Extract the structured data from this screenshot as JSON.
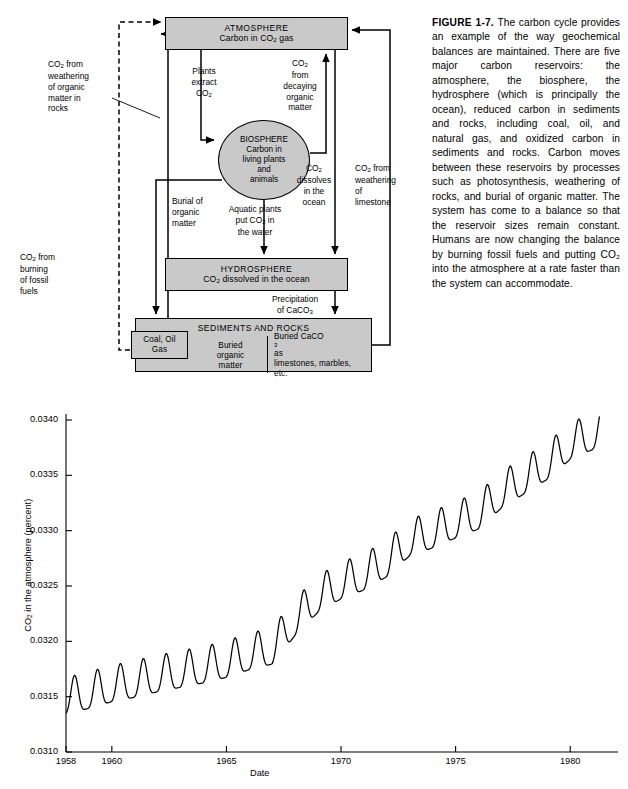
{
  "figure": {
    "number": "FIGURE 1-7.",
    "caption": " The carbon cycle provides an example of the way geochemical balances are maintained. There are five major carbon reservoirs: the atmosphere, the biosphere, the hydrosphere (which is principally the ocean), reduced carbon in sediments and rocks, including coal, oil, and natural gas, and oxidized carbon in sediments and rocks. Carbon moves between these reservoirs by processes such as photosynthesis, weathering of rocks, and burial of organic matter. The system has come to a balance so that the reservoir sizes remain constant. Humans are now changing the balance by burning fossil fuels and putting CO₂ into the atmosphere at a rate faster than the system can accommodate."
  },
  "diagram": {
    "boxes": {
      "atmosphere": {
        "title": "ATMOSPHERE",
        "subtitle": "Carbon in CO₂ gas"
      },
      "hydrosphere": {
        "title": "HYDROSPHERE",
        "subtitle": "CO₂ dissolved in the ocean"
      },
      "sediments": {
        "title": "SEDIMENTS AND ROCKS",
        "cells": [
          {
            "name": "coal-oil-gas",
            "text": "Coal, Oil\nGas"
          },
          {
            "name": "buried-organic-matter",
            "text": "Buried\norganic\nmatter"
          },
          {
            "name": "buried-caco3",
            "text": "Buried CaCO₃ as\nlimestones, marbles,\netc."
          }
        ]
      },
      "biosphere": {
        "title": "BIOSPHERE",
        "subtitle": "Carbon in\nliving plants\nand\nanimals"
      }
    },
    "flow_labels": {
      "plants_extract": "Plants\nextract\nCO₂",
      "decaying_organic": "CO₂\nfrom\ndecaying\norganic\nmatter",
      "co2_dissolves": "CO₂\ndissolves\nin the\nocean",
      "burial_organic": "Burial of\norganic\nmatter",
      "aquatic_plants": "Aquatic plants\nput CO₂ in\nthe water",
      "precipitation_caco3": "Precipitation\nof CaCO₃",
      "weathering_organic": "CO₂ from\nweathering\nof organic\nmatter in\nrocks",
      "burning_fossil": "CO₂ from\nburning\nof fossil\nfuels",
      "weathering_limestone": "CO₂ from\nweathering\nof\nlimestone"
    },
    "colors": {
      "box_fill": "#c9c9c9",
      "stroke": "#000000"
    }
  },
  "chart_data": {
    "type": "line",
    "title": "",
    "xlabel": "Date",
    "ylabel": "CO₂ in the atmosphere (percent)",
    "xlim": [
      1958.0,
      1981.3
    ],
    "ylim": [
      0.031,
      0.034
    ],
    "xticks": [
      1958,
      1960,
      1965,
      1970,
      1975,
      1980
    ],
    "xtick_labels": [
      "1958",
      "1960",
      "1965",
      "1970",
      "1975",
      "1980"
    ],
    "yticks": [
      0.031,
      0.0315,
      0.032,
      0.0325,
      0.033,
      0.0335,
      0.034
    ],
    "ytick_labels": [
      "0.0310",
      "0.0315",
      "0.0320",
      "0.0325",
      "0.0330",
      "0.0335",
      "0.0340"
    ],
    "grid": false,
    "legend": null,
    "series": [
      {
        "name": "Atmospheric CO2 at Mauna Loa (monthly mean, percent)",
        "description": "Keeling curve: rising trend with annual seasonal oscillation, amplitude about 0.00035 percent",
        "trend_annual_means": [
          {
            "year": 1958,
            "value": 0.03151
          },
          {
            "year": 1959,
            "value": 0.03156
          },
          {
            "year": 1960,
            "value": 0.03162
          },
          {
            "year": 1961,
            "value": 0.03166
          },
          {
            "year": 1962,
            "value": 0.03171
          },
          {
            "year": 1963,
            "value": 0.03175
          },
          {
            "year": 1964,
            "value": 0.03179
          },
          {
            "year": 1965,
            "value": 0.03184
          },
          {
            "year": 1966,
            "value": 0.03191
          },
          {
            "year": 1967,
            "value": 0.03196
          },
          {
            "year": 1968,
            "value": 0.03222
          },
          {
            "year": 1969,
            "value": 0.03243
          },
          {
            "year": 1970,
            "value": 0.03255
          },
          {
            "year": 1971,
            "value": 0.03263
          },
          {
            "year": 1972,
            "value": 0.03275
          },
          {
            "year": 1973,
            "value": 0.03294
          },
          {
            "year": 1974,
            "value": 0.03301
          },
          {
            "year": 1975,
            "value": 0.0331
          },
          {
            "year": 1976,
            "value": 0.03318
          },
          {
            "year": 1977,
            "value": 0.03337
          },
          {
            "year": 1978,
            "value": 0.0335
          },
          {
            "year": 1979,
            "value": 0.03363
          },
          {
            "year": 1980,
            "value": 0.03381
          },
          {
            "year": 1981,
            "value": 0.0339
          }
        ],
        "seasonal_amplitude": 0.00033,
        "seasonal_peak_month": 5,
        "seasonal_trough_month": 10
      }
    ]
  }
}
